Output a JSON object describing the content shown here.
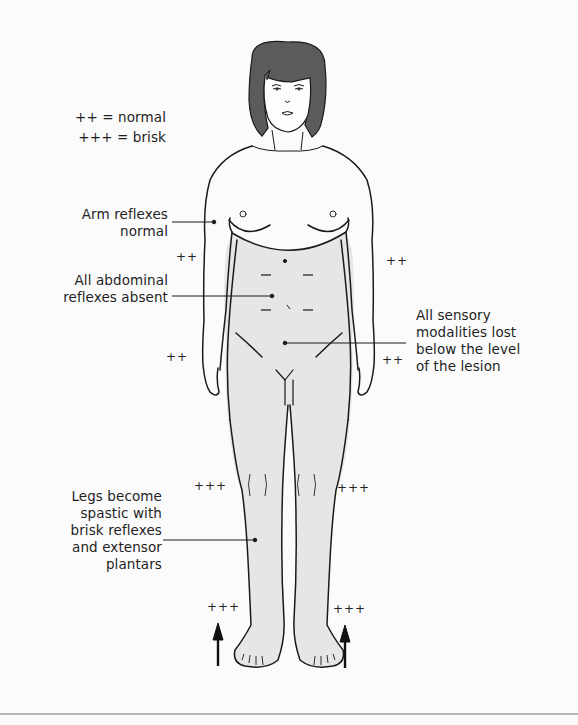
{
  "legend": {
    "normal": "++ = normal",
    "brisk": "+++ = brisk"
  },
  "labels": {
    "arm_reflexes": [
      "Arm reflexes",
      "normal"
    ],
    "abdominal": [
      "All abdominal",
      "reflexes absent"
    ],
    "sensory": [
      "All sensory",
      "modalities lost",
      "below the level",
      "of the lesion"
    ],
    "legs": [
      "Legs become",
      "spastic with",
      "brisk reflexes",
      "and extensor",
      "plantars"
    ]
  },
  "reflex_marks": {
    "left_upper_arm": "++",
    "right_upper_arm": "++",
    "left_forearm": "++",
    "right_forearm": "++",
    "left_knee": "+++",
    "right_knee": "+++",
    "left_ankle": "+++",
    "right_ankle": "+++"
  },
  "abdominal_marks": [
    "–",
    "–",
    "–",
    "–"
  ],
  "colors": {
    "affected_region_fill": "#e6e6e6",
    "hair": "#5a5a5a",
    "outline": "#1a1a1a",
    "background": "#fbfbfb"
  }
}
